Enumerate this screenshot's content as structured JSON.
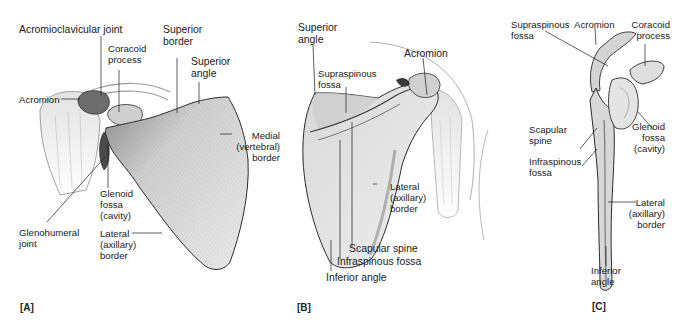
{
  "figure": {
    "panels": [
      {
        "id": "A",
        "tag": "[A]",
        "view": "anterior",
        "labels": {
          "acromioclavicular_joint": "Acromioclavicular joint",
          "coracoid_process": "Coracoid\nprocess",
          "superior_border": "Superior\nborder",
          "superior_angle": "Superior\nangle",
          "acromion": "Acromion",
          "medial_border": "Medial\n(vertebral)\nborder",
          "glenoid_fossa": "Glenoid\nfossa\n(cavity)",
          "glenohumeral_joint": "Glenohumeral\njoint",
          "lateral_border": "Lateral\n(axillary)\nborder"
        }
      },
      {
        "id": "B",
        "tag": "[B]",
        "view": "posterior",
        "labels": {
          "superior_angle": "Superior\nangle",
          "acromion": "Acromion",
          "supraspinous_fossa": "Supraspinous\nfossa",
          "lateral_border": "Lateral\n(axillary)\nborder",
          "scapular_spine": "Scapular spine",
          "infraspinous_fossa": "Infraspinous fossa",
          "inferior_angle": "Inferior angle"
        }
      },
      {
        "id": "C",
        "tag": "[C]",
        "view": "lateral",
        "labels": {
          "supraspinous_fossa": "Supraspinous\nfossa",
          "acromion": "Acromion",
          "coracoid_process": "Coracoid\nprocess",
          "scapular_spine": "Scapular\nspine",
          "glenoid_fossa": "Glenoid\nfossa\n(cavity)",
          "infraspinous_fossa": "Infraspinous\nfossa",
          "lateral_border": "Lateral\n(axillary)\nborder",
          "inferior_angle": "Inferior\nangle"
        }
      }
    ],
    "colors": {
      "bone_fill": "#e6e6e6",
      "bone_shade": "#b8b8b8",
      "bone_dark": "#6a6a6a",
      "outline": "#2a2a2a",
      "leader": "#1a1a1a"
    }
  }
}
